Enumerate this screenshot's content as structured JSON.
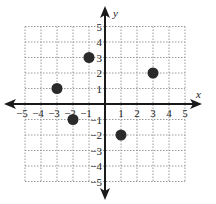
{
  "chart_data": {
    "type": "scatter",
    "title": "",
    "xlabel": "x",
    "ylabel": "y",
    "xlim": [
      -5,
      5
    ],
    "ylim": [
      -5,
      5
    ],
    "grid": true,
    "x_ticks": [
      -5,
      -4,
      -3,
      -2,
      -1,
      1,
      2,
      3,
      4,
      5
    ],
    "y_ticks": [
      -5,
      -4,
      -3,
      -2,
      -1,
      1,
      2,
      3,
      4,
      5
    ],
    "x_tick_labels": [
      "−5",
      "−4",
      "−3",
      "−2",
      "−1",
      "1",
      "2",
      "3",
      "4",
      "5"
    ],
    "y_tick_labels": [
      "−5",
      "−4",
      "−3",
      "−2",
      "−1",
      "1",
      "2",
      "3",
      "4",
      "5"
    ],
    "points": [
      {
        "x": -3,
        "y": 1
      },
      {
        "x": -1,
        "y": 3
      },
      {
        "x": 3,
        "y": 2
      },
      {
        "x": -2,
        "y": -1
      },
      {
        "x": 1,
        "y": -2
      }
    ],
    "colors": {
      "point": "#2a2a2a",
      "axis": "#1a1a1a",
      "grid": "#9a9a9a"
    }
  }
}
